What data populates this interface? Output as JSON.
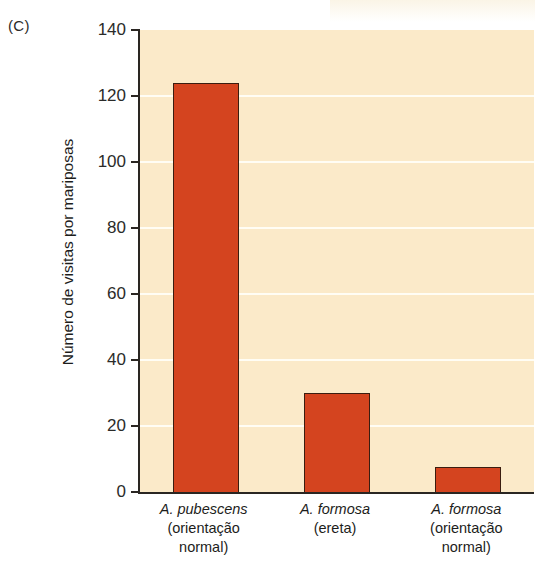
{
  "panel": {
    "label": "(C)"
  },
  "chart_data": {
    "type": "bar",
    "title": "",
    "xlabel": "",
    "ylabel": "Número de visitas por mariposas",
    "ylim": [
      0,
      140
    ],
    "yticks": [
      0,
      20,
      40,
      60,
      80,
      100,
      120,
      140
    ],
    "grid": "horizontal",
    "legend": "none",
    "categories": [
      "A. pubescens (orientação normal)",
      "A. formosa (ereta)",
      "A. formosa (orientação normal)"
    ],
    "category_parts": [
      {
        "species": "A. pubescens",
        "detail_1": "(orientação",
        "detail_2": "normal)"
      },
      {
        "species": "A. formosa",
        "detail_1": "(ereta)",
        "detail_2": ""
      },
      {
        "species": "A. formosa",
        "detail_1": "(orientação",
        "detail_2": "normal)"
      }
    ],
    "values": [
      124,
      30,
      7.5
    ],
    "colors": {
      "bar_fill": "#d4441f",
      "bar_stroke": "#3a1d10",
      "plot_background": "#fbeac9",
      "gridline": "#fffdf4",
      "axis": "#2a2622",
      "page_background": "#ffffff"
    }
  }
}
